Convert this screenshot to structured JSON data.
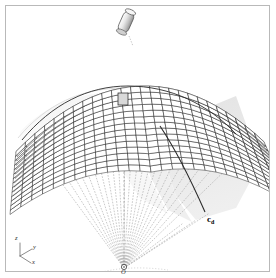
{
  "figure": {
    "background_color": "#ffffff",
    "frame_color": "#b9b9b9"
  },
  "labels": {
    "curve_cd": "c",
    "curve_cd_sub": "d",
    "origin": "O",
    "axis_x": "x",
    "axis_y": "y",
    "axis_z": "z"
  },
  "colors": {
    "mesh_line": "#1a1a1a",
    "mesh_fill": "#ffffff",
    "mesh_shade": "#c8c8c8",
    "ray_dotted": "#9a9a9a",
    "shadow_band": "#e3e3e3",
    "surface_shadow": "#efefef",
    "curve_cd": "#2a2a2a",
    "axis_line": "#6d6d6d",
    "cylinder_fill": "#e0e0e0",
    "cylinder_line": "#555555"
  },
  "geometry": {
    "origin_point": {
      "x": 124,
      "y": 268
    },
    "mesh_rows": 14,
    "mesh_cols": 26,
    "ray_count": 27,
    "cylinder": {
      "x": 126,
      "y": 22,
      "width": 11,
      "height": 22,
      "tilt_deg": 24
    },
    "highlight_cell": {
      "x": 123,
      "y": 99
    }
  }
}
